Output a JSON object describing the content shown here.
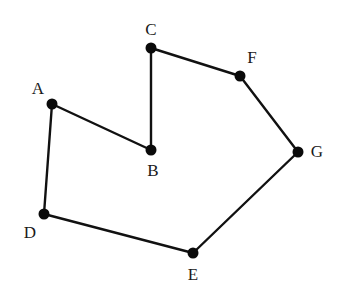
{
  "diagram": {
    "type": "polygon-graph",
    "colors": {
      "line": "#111111",
      "vertex": "#0a0a0a",
      "label": "#1a1a1a",
      "background": "#ffffff"
    },
    "vertices": [
      {
        "id": "A",
        "label": "A",
        "x": 52,
        "y": 104,
        "lx": 38,
        "ly": 90
      },
      {
        "id": "B",
        "label": "B",
        "x": 151,
        "y": 150,
        "lx": 153,
        "ly": 172
      },
      {
        "id": "C",
        "label": "C",
        "x": 151,
        "y": 48,
        "lx": 151,
        "ly": 31
      },
      {
        "id": "F",
        "label": "F",
        "x": 240,
        "y": 76,
        "lx": 252,
        "ly": 59
      },
      {
        "id": "G",
        "label": "G",
        "x": 298,
        "y": 152,
        "lx": 317,
        "ly": 153
      },
      {
        "id": "E",
        "label": "E",
        "x": 193,
        "y": 253,
        "lx": 193,
        "ly": 276
      },
      {
        "id": "D",
        "label": "D",
        "x": 44,
        "y": 214,
        "lx": 30,
        "ly": 234
      }
    ],
    "edges": [
      [
        "A",
        "B"
      ],
      [
        "B",
        "C"
      ],
      [
        "C",
        "F"
      ],
      [
        "F",
        "G"
      ],
      [
        "G",
        "E"
      ],
      [
        "E",
        "D"
      ],
      [
        "D",
        "A"
      ]
    ]
  }
}
